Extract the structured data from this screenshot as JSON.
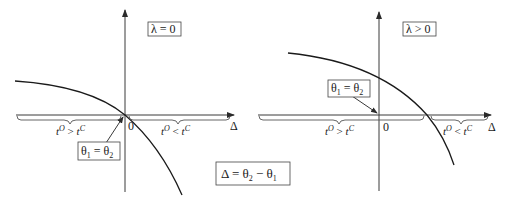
{
  "panels": [
    {
      "condition_label": "λ = 0",
      "origin_label": "0",
      "axis_label": "Δ",
      "intersection_label": {
        "theta_a": "θ",
        "sub_a": "1",
        "eq": " = ",
        "theta_b": "θ",
        "sub_b": "2"
      },
      "left_region": {
        "t1": "t",
        "s1": "O",
        "op": " > ",
        "t2": "t",
        "s2": "C"
      },
      "right_region": {
        "t1": "t",
        "s1": "O",
        "op": " < ",
        "t2": "t",
        "s2": "C"
      }
    },
    {
      "condition_label": "λ > 0",
      "origin_label": "0",
      "axis_label": "Δ",
      "intersection_label": {
        "theta_a": "θ",
        "sub_a": "1",
        "eq": " = ",
        "theta_b": "θ",
        "sub_b": "2"
      },
      "left_region": {
        "t1": "t",
        "s1": "O",
        "op": " > ",
        "t2": "t",
        "s2": "C"
      },
      "right_region": {
        "t1": "t",
        "s1": "O",
        "op": " < ",
        "t2": "t",
        "s2": "C"
      }
    }
  ],
  "definition": {
    "delta": "Δ",
    "eq": " = ",
    "theta_a": "θ",
    "sub_a": "2",
    "minus": " − ",
    "theta_b": "θ",
    "sub_b": "1"
  }
}
